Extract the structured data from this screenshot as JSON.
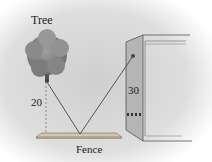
{
  "diagram": {
    "labels": {
      "tree": "Tree",
      "tree_height": "20",
      "building_height": "30",
      "fence": "Fence"
    },
    "colors": {
      "background_gradient_center": "#d4d4d4",
      "tree": "#8a8a8a",
      "fence": "#c8bfae",
      "lines": "#666666",
      "building_side": "#b4b4b4",
      "building_front": "#e0e0e0"
    }
  }
}
